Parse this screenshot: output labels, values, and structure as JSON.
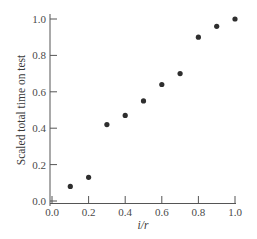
{
  "chart_data": {
    "type": "scatter",
    "title": "",
    "xlabel": "i/r",
    "ylabel": "Scaled total time on test",
    "xlim": [
      0.0,
      1.0
    ],
    "ylim": [
      0.0,
      1.0
    ],
    "x_ticks": [
      "0.0",
      "0.2",
      "0.4",
      "0.6",
      "0.8",
      "1.0"
    ],
    "y_ticks": [
      "0.0",
      "0.2",
      "0.4",
      "0.6",
      "0.8",
      "1.0"
    ],
    "grid": false,
    "legend": null,
    "series": [
      {
        "name": "TTT plot",
        "x": [
          0.1,
          0.2,
          0.3,
          0.4,
          0.5,
          0.6,
          0.7,
          0.8,
          0.9,
          1.0
        ],
        "y": [
          0.08,
          0.13,
          0.42,
          0.47,
          0.55,
          0.64,
          0.7,
          0.9,
          0.96,
          1.0
        ]
      }
    ],
    "colors": {
      "points": "#2e2e2e",
      "axes": "#555555",
      "text": "#3a3a3a"
    }
  }
}
